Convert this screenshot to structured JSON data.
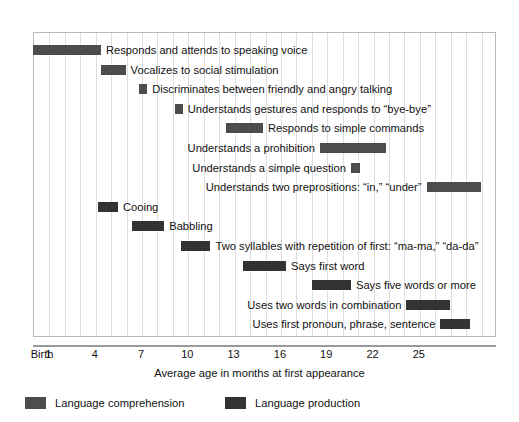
{
  "chart_data": {
    "type": "bar",
    "orientation": "horizontal-range",
    "title": "",
    "xlabel": "Average age in months at first appearance",
    "ylabel": "",
    "xlim": [
      0,
      30
    ],
    "grid": true,
    "legend_position": "bottom-left",
    "tick_labels": [
      "Birth",
      "1",
      "4",
      "7",
      "10",
      "13",
      "16",
      "19",
      "22",
      "25"
    ],
    "tick_values": [
      0,
      1,
      4,
      7,
      10,
      13,
      16,
      19,
      22,
      25
    ],
    "series": [
      {
        "name": "Language comprehension",
        "color": "#4d4d4d"
      },
      {
        "name": "Language production",
        "color": "#333333"
      }
    ],
    "bars": [
      {
        "label": "Responds and attends to speaking voice",
        "series": "Language comprehension",
        "start": 0.0,
        "end": 4.4,
        "label_side": "right"
      },
      {
        "label": "Vocalizes to social stimulation",
        "series": "Language comprehension",
        "start": 4.4,
        "end": 6.0,
        "label_side": "right"
      },
      {
        "label": "Discriminates between friendly and angry talking",
        "series": "Language comprehension",
        "start": 6.9,
        "end": 7.4,
        "label_side": "right"
      },
      {
        "label": "Understands gestures and responds to “bye-bye”",
        "series": "Language comprehension",
        "start": 9.2,
        "end": 9.7,
        "label_side": "right"
      },
      {
        "label": "Responds to simple commands",
        "series": "Language comprehension",
        "start": 12.5,
        "end": 14.9,
        "label_side": "right"
      },
      {
        "label": "Understands a prohibition",
        "series": "Language comprehension",
        "start": 18.6,
        "end": 22.9,
        "label_side": "left"
      },
      {
        "label": "Understands a simple question",
        "series": "Language comprehension",
        "start": 20.6,
        "end": 21.2,
        "label_side": "left"
      },
      {
        "label": "Understands two preprositions: “in,” “under”",
        "series": "Language comprehension",
        "start": 25.5,
        "end": 29.0,
        "label_side": "left"
      },
      {
        "label": "Cooing",
        "series": "Language production",
        "start": 4.2,
        "end": 5.5,
        "label_side": "right"
      },
      {
        "label": "Babbling",
        "series": "Language production",
        "start": 6.4,
        "end": 8.5,
        "label_side": "right"
      },
      {
        "label": "Two syllables with repetition of first: “ma-ma,” “da-da”",
        "series": "Language production",
        "start": 9.6,
        "end": 11.5,
        "label_side": "right"
      },
      {
        "label": "Says first word",
        "series": "Language production",
        "start": 13.6,
        "end": 16.4,
        "label_side": "right"
      },
      {
        "label": "Says five words or more",
        "series": "Language production",
        "start": 18.1,
        "end": 20.6,
        "label_side": "right"
      },
      {
        "label": "Uses two words in combination",
        "series": "Language production",
        "start": 24.2,
        "end": 27.0,
        "label_side": "left"
      },
      {
        "label": "Uses first pronoun, phrase, sentence",
        "series": "Language production",
        "start": 26.4,
        "end": 28.3,
        "label_side": "left"
      }
    ]
  },
  "axis": {
    "title": "Average age in months at first appearance",
    "ticks": [
      {
        "text": "Birth",
        "value": 0
      },
      {
        "text": "1",
        "value": 1
      },
      {
        "text": "4",
        "value": 4
      },
      {
        "text": "7",
        "value": 7
      },
      {
        "text": "10",
        "value": 10
      },
      {
        "text": "13",
        "value": 13
      },
      {
        "text": "16",
        "value": 16
      },
      {
        "text": "19",
        "value": 19
      },
      {
        "text": "22",
        "value": 22
      },
      {
        "text": "25",
        "value": 25
      }
    ]
  },
  "legend": {
    "items": [
      {
        "label": "Language comprehension",
        "color": "#4d4d4d"
      },
      {
        "label": "Language production",
        "color": "#333333"
      }
    ]
  }
}
